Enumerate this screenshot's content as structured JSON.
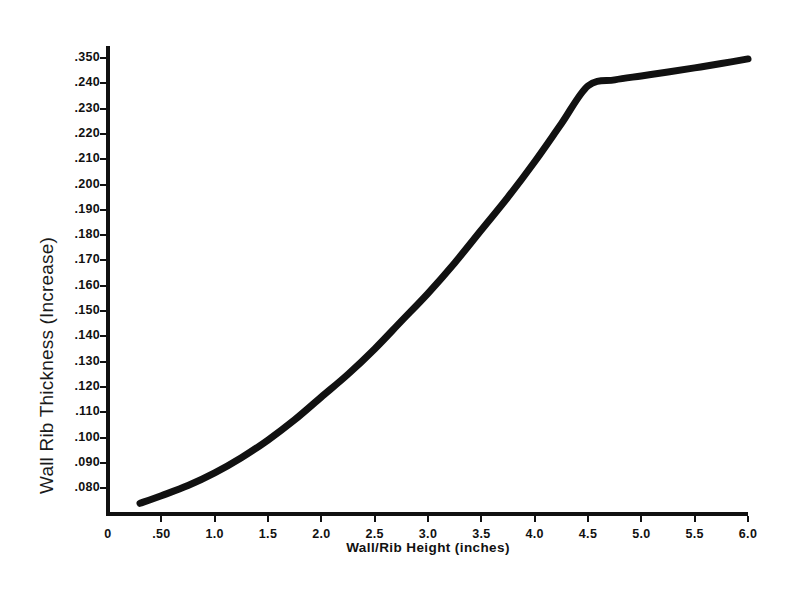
{
  "chart_data": {
    "type": "line",
    "title": "",
    "xlabel": "Wall/Rib Height (inches)",
    "ylabel": "Wall Rib Thickness (Increase)",
    "x_tick_labels": [
      "0",
      ".50",
      "1.0",
      "1.5",
      "2.0",
      "2.5",
      "3.0",
      "3.5",
      "4.0",
      "4.5",
      "5.0",
      "5.5",
      "6.0"
    ],
    "x_tick_values": [
      0,
      0.5,
      1.0,
      1.5,
      2.0,
      2.5,
      3.0,
      3.5,
      4.0,
      4.5,
      5.0,
      5.5,
      6.0
    ],
    "y_tick_labels": [
      ".350",
      ".240",
      ".230",
      ".220",
      ".210",
      ".200",
      ".190",
      ".180",
      ".170",
      ".160",
      ".150",
      ".140",
      ".130",
      ".120",
      ".110",
      ".100",
      ".090",
      ".080"
    ],
    "xlim": [
      0,
      6.0
    ],
    "grid": false,
    "legend": false,
    "series": [
      {
        "name": "Wall/Rib thickness increase",
        "x": [
          0.3,
          0.5,
          0.75,
          1.0,
          1.25,
          1.5,
          1.75,
          2.0,
          2.25,
          2.5,
          2.75,
          3.0,
          3.25,
          3.5,
          3.75,
          4.0,
          4.25,
          4.5,
          4.75,
          5.0,
          5.25,
          5.5,
          5.75,
          6.0
        ],
        "y": [
          0.074,
          0.077,
          0.081,
          0.086,
          0.092,
          0.099,
          0.107,
          0.116,
          0.125,
          0.135,
          0.146,
          0.157,
          0.169,
          0.182,
          0.195,
          0.209,
          0.224,
          0.239,
          0.255,
          0.272,
          0.289,
          0.307,
          0.326,
          0.346
        ]
      }
    ],
    "line_color": "#111111",
    "line_width": 7
  },
  "axis": {
    "color": "#111111"
  }
}
